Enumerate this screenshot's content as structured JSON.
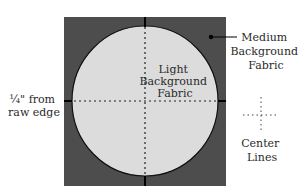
{
  "diagram": {
    "colors": {
      "background": "#ffffff",
      "medium_fabric": "#4d4d4d",
      "light_fabric": "#dcdcdc",
      "outline": "#111111",
      "text": "#2a2a2a"
    },
    "labels": {
      "medium": [
        "Medium",
        "Background",
        "Fabric"
      ],
      "light": [
        "Light",
        "Background",
        "Fabric"
      ],
      "seam": [
        "¼\" from",
        "raw edge"
      ],
      "center": [
        "Center",
        "Lines"
      ]
    }
  }
}
